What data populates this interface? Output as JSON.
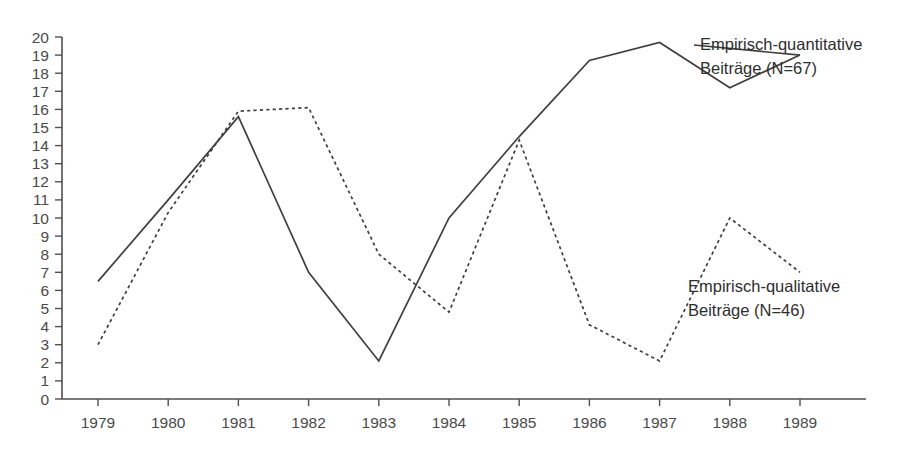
{
  "chart_data": {
    "type": "line",
    "title": "",
    "subtitle": "",
    "xlabel": "",
    "ylabel": "",
    "xlim": [
      1979,
      1989
    ],
    "ylim": [
      0,
      20
    ],
    "grid": false,
    "legend_position": "right-inline-annotations",
    "categories": [
      "1979",
      "1980",
      "1981",
      "1982",
      "1983",
      "1984",
      "1985",
      "1986",
      "1987",
      "1988",
      "1989"
    ],
    "x": [
      1979,
      1980,
      1981,
      1982,
      1983,
      1984,
      1985,
      1986,
      1987,
      1988,
      1989
    ],
    "ytick_labels": [
      "20",
      "19",
      "18",
      "17",
      "16",
      "15",
      "14",
      "13",
      "12",
      "11",
      "10",
      "9",
      "8",
      "7",
      "6",
      "5",
      "4",
      "3",
      "2",
      "1",
      "0"
    ],
    "yticks": [
      20,
      19,
      18,
      17,
      16,
      15,
      14,
      13,
      12,
      11,
      10,
      9,
      8,
      7,
      6,
      5,
      4,
      3,
      2,
      1,
      0
    ],
    "series": [
      {
        "name": "Empirisch-quantitative Beiträge (N=67)",
        "style": "solid",
        "color": "#3f3f3f",
        "values": [
          6.5,
          11,
          15.6,
          7,
          2.1,
          10,
          14.5,
          18.7,
          19.7,
          17.2,
          19
        ]
      },
      {
        "name": "Empirisch-qualitative Beiträge (N=46)",
        "style": "dashed",
        "color": "#3f3f3f",
        "values": [
          3,
          10.3,
          15.9,
          16.1,
          8,
          4.8,
          14.3,
          4.1,
          2.1,
          10,
          7
        ]
      }
    ],
    "annotations": [
      {
        "id": "annotation-quantitative",
        "line1": "Empirisch-quantitative",
        "line2": "Beiträge (N=67)"
      },
      {
        "id": "annotation-qualitative",
        "line1": "Empirisch-qualitative",
        "line2": "Beiträge (N=46)"
      }
    ]
  }
}
